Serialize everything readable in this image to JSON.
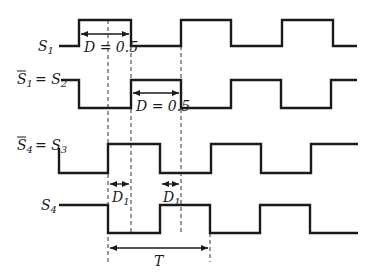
{
  "diagram": {
    "type": "timing-diagram",
    "signals": [
      {
        "name": "S1",
        "label_main": "S",
        "label_sub": "1",
        "label_prefix": "",
        "bar": false,
        "high_y": 20,
        "low_y": 46,
        "points": "59,46 79,46 79,20 131,20 131,46 181,46 181,20 231,20 231,46 282,46 282,20 333,20 333,46 357,46"
      },
      {
        "name": "S1bar = S2",
        "label_main": "S",
        "label_sub": "1",
        "label_eq": " = S",
        "label_eq_sub": "2",
        "bar": true,
        "high_y": 80,
        "low_y": 108,
        "points": "61,80 79,80 79,108 131,108 131,80 181,80 181,108 231,108 231,80 281,80 281,108 331,108 331,80 357,80"
      },
      {
        "name": "S4bar = S3",
        "label_main": "S",
        "label_sub": "4",
        "label_eq": " = S",
        "label_eq_sub": "3",
        "bar": true,
        "high_y": 144,
        "low_y": 173,
        "points": "59,148 59,173 108,173 108,144 160,144 160,173 211,173 211,144 261,144 261,173 311,173 311,144 358,144"
      },
      {
        "name": "S4",
        "label_main": "S",
        "label_sub": "4",
        "bar": false,
        "high_y": 205,
        "low_y": 233,
        "points": "59,205 108,205 108,233 160,233 160,205 210,205 210,233 260,233 260,205 310,205 310,233 358,233"
      }
    ],
    "annotations": {
      "duty_s1": {
        "text_main": "D = 0.5"
      },
      "duty_s2": {
        "text_main": "D = 0.5"
      },
      "delay_1": {
        "text_main": "D",
        "text_sub": "1"
      },
      "delay_2": {
        "text_main": "D",
        "text_sub": "1"
      },
      "period": {
        "text_main": "T"
      }
    },
    "labels": {
      "s1": "S",
      "s1_sub": "1",
      "s2_left": "S",
      "s2_left_sub": "1",
      "s2_eq": "= S",
      "s2_eq_sub": "2",
      "s3_left": "S",
      "s3_left_sub": "4",
      "s3_eq": "= S",
      "s3_eq_sub": "3",
      "s4": "S",
      "s4_sub": "4",
      "d_half": "D = 0.5",
      "d1": "D",
      "d1_sub": "1",
      "period": "T"
    },
    "colors": {
      "stroke": "#1a1a1a",
      "background": "#ffffff"
    }
  }
}
